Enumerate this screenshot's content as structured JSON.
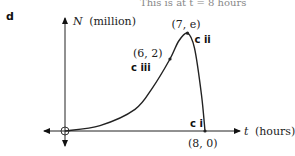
{
  "header": {
    "part_label": "d",
    "top_cut_text": "This is at t = 8 hours"
  },
  "chart_data": {
    "type": "line",
    "title": "",
    "xlabel": "t (hours)",
    "ylabel": "N (million)",
    "xlabel_var": "t",
    "xlabel_unit": "(hours)",
    "ylabel_var": "N",
    "ylabel_unit": "(million)",
    "xlim": [
      -1.3,
      10
    ],
    "ylim": [
      -0.5,
      3.5
    ],
    "grid": false,
    "origin_marker": "open-circle",
    "series": [
      {
        "name": "N(t)",
        "description": "growth curve rising from origin, peaking at (7, e), falling to (8, 0)",
        "points": [
          {
            "x": 0,
            "y": 0
          },
          {
            "x": 2,
            "y": 0.15
          },
          {
            "x": 4,
            "y": 0.6
          },
          {
            "x": 5,
            "y": 1.2
          },
          {
            "x": 6,
            "y": 2
          },
          {
            "x": 6.5,
            "y": 2.5
          },
          {
            "x": 7,
            "y": 2.718
          },
          {
            "x": 7.4,
            "y": 2.3
          },
          {
            "x": 7.8,
            "y": 1.0
          },
          {
            "x": 8,
            "y": 0
          }
        ]
      }
    ],
    "annotations": [
      {
        "text": "(7, e)",
        "x": 7,
        "y": 2.718,
        "tag": "c ii"
      },
      {
        "text": "(6, 2)",
        "x": 6,
        "y": 2,
        "tag": "c iii"
      },
      {
        "text": "(8, 0)",
        "x": 8,
        "y": 0,
        "tag": "c i"
      }
    ]
  }
}
